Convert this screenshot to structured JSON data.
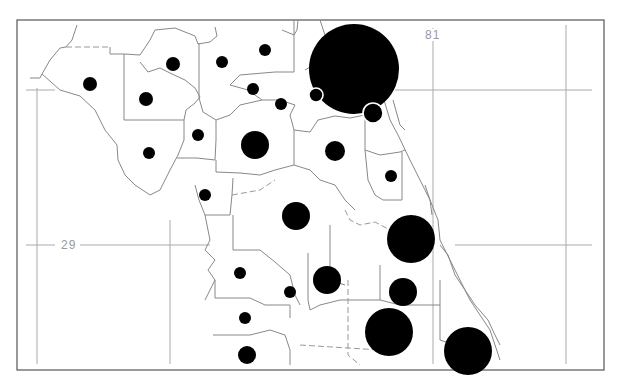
{
  "map": {
    "type": "proportional-symbol map",
    "frame": {
      "x": 17,
      "y": 20,
      "width": 587,
      "height": 350
    },
    "graticule": {
      "longitude_label": "81",
      "latitude_label": "29",
      "vertical_lines_x": [
        37,
        170,
        433,
        566
      ],
      "horizontal_lines_y": [
        90,
        245
      ]
    },
    "colors": {
      "symbol": "#000000",
      "boundary": "#888888",
      "grid": "#aaaaaa",
      "label": "#9a9a9a"
    },
    "symbols": [
      {
        "x": 90,
        "y": 84,
        "r": 7
      },
      {
        "x": 173,
        "y": 64,
        "r": 7
      },
      {
        "x": 146,
        "y": 99,
        "r": 7
      },
      {
        "x": 222,
        "y": 62,
        "r": 6
      },
      {
        "x": 265,
        "y": 50,
        "r": 6
      },
      {
        "x": 253,
        "y": 89,
        "r": 6
      },
      {
        "x": 281,
        "y": 104,
        "r": 6
      },
      {
        "x": 198,
        "y": 135,
        "r": 6
      },
      {
        "x": 149,
        "y": 153,
        "r": 6
      },
      {
        "x": 255,
        "y": 145,
        "r": 14
      },
      {
        "x": 205,
        "y": 195,
        "r": 6
      },
      {
        "x": 354,
        "y": 69,
        "r": 45
      },
      {
        "x": 316,
        "y": 95,
        "r": 7,
        "ring": true
      },
      {
        "x": 373,
        "y": 113,
        "r": 10,
        "ring": true
      },
      {
        "x": 335,
        "y": 151,
        "r": 10
      },
      {
        "x": 391,
        "y": 176,
        "r": 6
      },
      {
        "x": 296,
        "y": 216,
        "r": 14
      },
      {
        "x": 411,
        "y": 239,
        "r": 24
      },
      {
        "x": 240,
        "y": 273,
        "r": 6
      },
      {
        "x": 290,
        "y": 292,
        "r": 6
      },
      {
        "x": 327,
        "y": 280,
        "r": 14
      },
      {
        "x": 403,
        "y": 292,
        "r": 14
      },
      {
        "x": 245,
        "y": 318,
        "r": 6
      },
      {
        "x": 389,
        "y": 332,
        "r": 24
      },
      {
        "x": 247,
        "y": 355,
        "r": 9
      },
      {
        "x": 468,
        "y": 351,
        "r": 24
      }
    ]
  }
}
